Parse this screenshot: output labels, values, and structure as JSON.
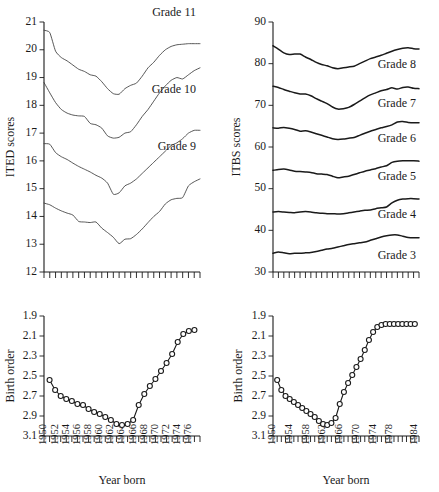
{
  "figure": {
    "panels": [
      "ited",
      "itbs",
      "birth_order_left",
      "birth_order_right"
    ]
  },
  "chart_data": [
    {
      "id": "ited",
      "type": "line",
      "title": "",
      "xlabel": "",
      "ylabel": "ITED scores",
      "ylim": [
        12,
        21
      ],
      "yticks": [
        12,
        13,
        14,
        15,
        16,
        17,
        18,
        19,
        20,
        21
      ],
      "xlim": [
        1950,
        1977
      ],
      "xticks_labeled": false,
      "n_xticks": 28,
      "grid": false,
      "legend": "inline-right",
      "x": [
        1950,
        1951,
        1952,
        1953,
        1954,
        1955,
        1956,
        1957,
        1958,
        1959,
        1960,
        1961,
        1962,
        1963,
        1964,
        1965,
        1966,
        1967,
        1968,
        1969,
        1970,
        1971,
        1972,
        1973,
        1974,
        1975,
        1976,
        1977
      ],
      "series": [
        {
          "name": "Grade 12",
          "label": "Grade 12",
          "values": [
            20.7,
            20.62,
            19.95,
            19.72,
            19.6,
            19.45,
            19.3,
            19.22,
            19.1,
            19.05,
            18.85,
            18.6,
            18.42,
            18.4,
            18.6,
            18.72,
            18.8,
            19.05,
            19.35,
            19.55,
            19.8,
            20.0,
            20.12,
            20.18,
            20.2,
            20.22,
            20.22,
            20.22
          ]
        },
        {
          "name": "Grade 11",
          "label": "Grade 11",
          "values": [
            18.82,
            18.45,
            18.1,
            17.85,
            17.72,
            17.65,
            17.62,
            17.6,
            17.35,
            17.3,
            17.18,
            16.9,
            16.82,
            16.85,
            17.0,
            17.05,
            17.3,
            17.6,
            17.85,
            18.15,
            18.45,
            18.7,
            18.9,
            19.0,
            18.95,
            19.1,
            19.25,
            19.35
          ]
        },
        {
          "name": "Grade 10",
          "label": "Grade 10",
          "values": [
            16.62,
            16.6,
            16.3,
            16.15,
            16.05,
            15.92,
            15.8,
            15.7,
            15.6,
            15.48,
            15.38,
            15.2,
            14.8,
            14.85,
            15.1,
            15.2,
            15.35,
            15.55,
            15.75,
            15.95,
            16.15,
            16.35,
            16.55,
            16.65,
            16.8,
            17.0,
            17.1,
            17.1
          ]
        },
        {
          "name": "Grade 9",
          "label": "Grade 9",
          "values": [
            14.48,
            14.42,
            14.3,
            14.2,
            14.12,
            14.05,
            13.82,
            13.8,
            13.78,
            13.8,
            13.58,
            13.42,
            13.25,
            13.02,
            13.18,
            13.2,
            13.35,
            13.55,
            13.78,
            14.0,
            14.18,
            14.45,
            14.6,
            14.65,
            14.68,
            15.1,
            15.25,
            15.35
          ]
        }
      ]
    },
    {
      "id": "itbs",
      "type": "line",
      "title": "",
      "xlabel": "",
      "ylabel": "ITBS scores",
      "ylim": [
        30,
        90
      ],
      "yticks": [
        30,
        40,
        50,
        60,
        70,
        80,
        90
      ],
      "xlim": [
        1950,
        1977
      ],
      "xticks_labeled": false,
      "n_xticks": 28,
      "grid": false,
      "legend": "inline-right",
      "x": [
        1950,
        1951,
        1952,
        1953,
        1954,
        1955,
        1956,
        1957,
        1958,
        1959,
        1960,
        1961,
        1962,
        1963,
        1964,
        1965,
        1966,
        1967,
        1968,
        1969,
        1970,
        1971,
        1972,
        1973,
        1974,
        1975,
        1976,
        1977
      ],
      "series": [
        {
          "name": "Grade 8",
          "label": "Grade 8",
          "values": [
            84.3,
            83.5,
            82.6,
            82.2,
            82.3,
            82.3,
            81.6,
            81.0,
            80.3,
            79.8,
            79.5,
            79.0,
            78.8,
            79.0,
            79.2,
            79.4,
            80.0,
            80.6,
            81.2,
            81.6,
            82.0,
            82.5,
            83.0,
            83.4,
            83.7,
            83.8,
            83.6,
            83.5
          ]
        },
        {
          "name": "Grade 7",
          "label": "Grade 7",
          "values": [
            74.6,
            74.3,
            73.8,
            73.4,
            73.0,
            72.7,
            72.7,
            72.3,
            71.6,
            71.0,
            70.4,
            69.6,
            69.1,
            69.2,
            69.5,
            70.2,
            71.0,
            71.8,
            72.5,
            73.0,
            73.5,
            73.8,
            74.2,
            73.9,
            74.3,
            74.4,
            74.1,
            74.0
          ]
        },
        {
          "name": "Grade 6",
          "label": "Grade 6",
          "values": [
            64.6,
            64.5,
            64.7,
            64.5,
            64.2,
            63.8,
            63.9,
            63.6,
            63.2,
            62.8,
            62.4,
            62.0,
            61.8,
            61.9,
            62.1,
            62.3,
            62.8,
            63.3,
            63.8,
            64.2,
            64.6,
            64.9,
            65.3,
            66.0,
            66.1,
            65.9,
            65.8,
            65.8
          ]
        },
        {
          "name": "Grade 5",
          "label": "Grade 5",
          "values": [
            54.4,
            54.6,
            54.7,
            54.5,
            54.2,
            54.1,
            54.0,
            53.9,
            53.6,
            53.5,
            53.4,
            53.0,
            52.6,
            52.8,
            53.0,
            53.4,
            53.8,
            54.2,
            54.5,
            54.8,
            55.2,
            55.5,
            56.3,
            56.6,
            56.7,
            56.7,
            56.7,
            56.6
          ]
        },
        {
          "name": "Grade 4",
          "label": "Grade 4",
          "values": [
            44.4,
            44.5,
            44.4,
            44.3,
            44.2,
            44.4,
            44.5,
            44.4,
            44.2,
            44.1,
            44.0,
            44.0,
            43.9,
            44.0,
            44.2,
            44.4,
            44.6,
            44.8,
            44.9,
            45.2,
            45.4,
            45.6,
            46.6,
            47.2,
            47.5,
            47.6,
            47.6,
            47.5
          ]
        },
        {
          "name": "Grade 3",
          "label": "Grade 3",
          "values": [
            34.5,
            34.8,
            34.6,
            34.4,
            34.5,
            34.5,
            34.6,
            34.7,
            34.9,
            35.2,
            35.5,
            35.7,
            36.0,
            36.3,
            36.6,
            36.8,
            37.0,
            37.2,
            37.6,
            38.0,
            38.4,
            38.7,
            38.9,
            38.9,
            38.6,
            38.3,
            38.2,
            38.2
          ]
        }
      ]
    },
    {
      "id": "birth_order_left",
      "type": "line",
      "title": "",
      "xlabel": "Year born",
      "ylabel": "Birth order",
      "ylim": [
        1.9,
        3.1
      ],
      "yticks": [
        1.9,
        2.1,
        2.3,
        2.5,
        2.7,
        2.9,
        3.1
      ],
      "y_axis_inverted": true,
      "xlim": [
        1950,
        1978
      ],
      "xticks": [
        1950,
        1952,
        1954,
        1956,
        1958,
        1960,
        1962,
        1964,
        1966,
        1968,
        1970,
        1972,
        1974,
        1976
      ],
      "n_xticks": 29,
      "grid": false,
      "markers": "open-circle",
      "x": [
        1951,
        1952,
        1953,
        1954,
        1955,
        1956,
        1957,
        1958,
        1959,
        1960,
        1961,
        1962,
        1963,
        1964,
        1965,
        1966,
        1967,
        1968,
        1969,
        1970,
        1971,
        1972,
        1973,
        1974,
        1975,
        1976,
        1977
      ],
      "values": [
        2.54,
        2.64,
        2.7,
        2.73,
        2.75,
        2.78,
        2.79,
        2.83,
        2.86,
        2.88,
        2.91,
        2.94,
        2.98,
        2.99,
        2.98,
        2.94,
        2.79,
        2.68,
        2.6,
        2.53,
        2.45,
        2.37,
        2.28,
        2.16,
        2.08,
        2.05,
        2.04
      ]
    },
    {
      "id": "birth_order_right",
      "type": "line",
      "title": "",
      "xlabel": "Year born",
      "ylabel": "Birth order",
      "ylim": [
        1.9,
        3.1
      ],
      "yticks": [
        1.9,
        2.1,
        2.3,
        2.5,
        2.7,
        2.9,
        3.1
      ],
      "y_axis_inverted": true,
      "xlim": [
        1950,
        1985
      ],
      "xticks": [
        1950,
        1954,
        1958,
        1962,
        1966,
        1970,
        1974,
        1978,
        1984
      ],
      "n_xticks": 36,
      "grid": false,
      "markers": "open-circle",
      "x": [
        1951,
        1952,
        1953,
        1954,
        1955,
        1956,
        1957,
        1958,
        1959,
        1960,
        1961,
        1962,
        1963,
        1964,
        1965,
        1966,
        1967,
        1968,
        1969,
        1970,
        1971,
        1972,
        1973,
        1974,
        1975,
        1976,
        1977,
        1978,
        1979,
        1980,
        1981,
        1982,
        1983,
        1984
      ],
      "values": [
        2.54,
        2.64,
        2.7,
        2.73,
        2.76,
        2.79,
        2.82,
        2.85,
        2.88,
        2.91,
        2.95,
        2.98,
        2.99,
        2.97,
        2.92,
        2.78,
        2.66,
        2.57,
        2.49,
        2.41,
        2.33,
        2.24,
        2.14,
        2.06,
        2.01,
        1.99,
        1.98,
        1.98,
        1.98,
        1.98,
        1.98,
        1.98,
        1.98,
        1.98
      ]
    }
  ]
}
